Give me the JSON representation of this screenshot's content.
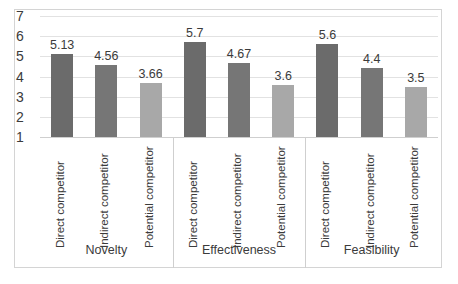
{
  "chart_data": {
    "type": "bar",
    "title": "",
    "subtitle": "",
    "xlabel": "",
    "ylabel": "",
    "ylim": [
      1,
      7
    ],
    "yticks": [
      "7",
      "6",
      "5",
      "4",
      "3",
      "2",
      "1"
    ],
    "grid": true,
    "legend": "none",
    "categories": [
      "Novelty",
      "Effectiveness",
      "Feasibility"
    ],
    "series_names": [
      "Direct competitor",
      "Indirect competitor",
      "Potential competitor"
    ],
    "groups": [
      {
        "category": "Novelty",
        "bars": [
          {
            "series": "Direct competitor",
            "value": 5.13,
            "label": "5.13",
            "color": "#6b6b6b"
          },
          {
            "series": "Indirect competitor",
            "value": 4.56,
            "label": "4.56",
            "color": "#767676"
          },
          {
            "series": "Potential competitor",
            "value": 3.66,
            "label": "3.66",
            "color": "#a8a8a8"
          }
        ]
      },
      {
        "category": "Effectiveness",
        "bars": [
          {
            "series": "Direct competitor",
            "value": 5.7,
            "label": "5.7",
            "color": "#6b6b6b"
          },
          {
            "series": "Indirect competitor",
            "value": 4.67,
            "label": "4.67",
            "color": "#767676"
          },
          {
            "series": "Potential competitor",
            "value": 3.6,
            "label": "3.6",
            "color": "#a8a8a8"
          }
        ]
      },
      {
        "category": "Feasibility",
        "bars": [
          {
            "series": "Direct competitor",
            "value": 5.6,
            "label": "5.6",
            "color": "#6b6b6b"
          },
          {
            "series": "Indirect competitor",
            "value": 4.4,
            "label": "4.4",
            "color": "#767676"
          },
          {
            "series": "Potential competitor",
            "value": 3.5,
            "label": "3.5",
            "color": "#a8a8a8"
          }
        ]
      }
    ],
    "colors": {
      "bar_direct": "#6b6b6b",
      "bar_indirect": "#767676",
      "bar_potential": "#a8a8a8",
      "gridline": "#e2e2e2",
      "frame": "#d4d4d4",
      "text": "#3b3b3b",
      "background": "#ffffff"
    }
  }
}
